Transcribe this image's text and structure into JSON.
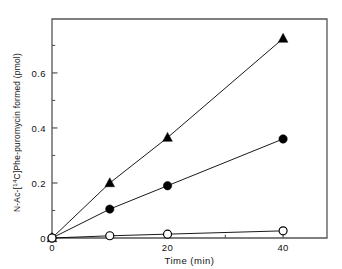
{
  "figure": {
    "background_color": "#ffffff",
    "axis_color": "#555555",
    "data_color": "#000000"
  },
  "axes": {
    "x_title": "Time (min)",
    "y_title_parts": {
      "pre": "N-Ac-[",
      "sup": "14",
      "post": "C]Phe-puromycin  formed  (pmol)"
    },
    "y_title_full": "N-Ac-[14C]Phe-puromycin formed (pmol)",
    "x_ticklabels": [
      "0",
      "20",
      "40"
    ],
    "y_ticklabels": [
      "0",
      "0.2",
      "0.4",
      "0.6"
    ]
  },
  "chart_data": {
    "type": "line",
    "title": "",
    "xlabel": "Time (min)",
    "ylabel": "N-Ac-[14C]Phe-puromycin formed (pmol)",
    "xlim": [
      0,
      47.6
    ],
    "ylim": [
      0,
      0.796
    ],
    "xticks": [
      0,
      20,
      40
    ],
    "yticks": [
      0,
      0.2,
      0.4,
      0.6
    ],
    "xminorticks": [
      10,
      30
    ],
    "yminorticks": [
      0.1,
      0.3,
      0.5,
      0.7
    ],
    "grid": false,
    "legend": "none",
    "series": [
      {
        "name": "filled-triangle-series",
        "marker": "filled-triangle",
        "x": [
          0,
          10,
          20,
          40
        ],
        "values": [
          0,
          0.2,
          0.365,
          0.725
        ]
      },
      {
        "name": "filled-circle-series",
        "marker": "filled-circle",
        "x": [
          0,
          10,
          20,
          40
        ],
        "values": [
          0,
          0.105,
          0.19,
          0.36
        ]
      },
      {
        "name": "open-circle-series",
        "marker": "open-circle",
        "x": [
          0,
          10,
          20,
          40
        ],
        "values": [
          0,
          0.008,
          0.014,
          0.026
        ]
      }
    ]
  }
}
